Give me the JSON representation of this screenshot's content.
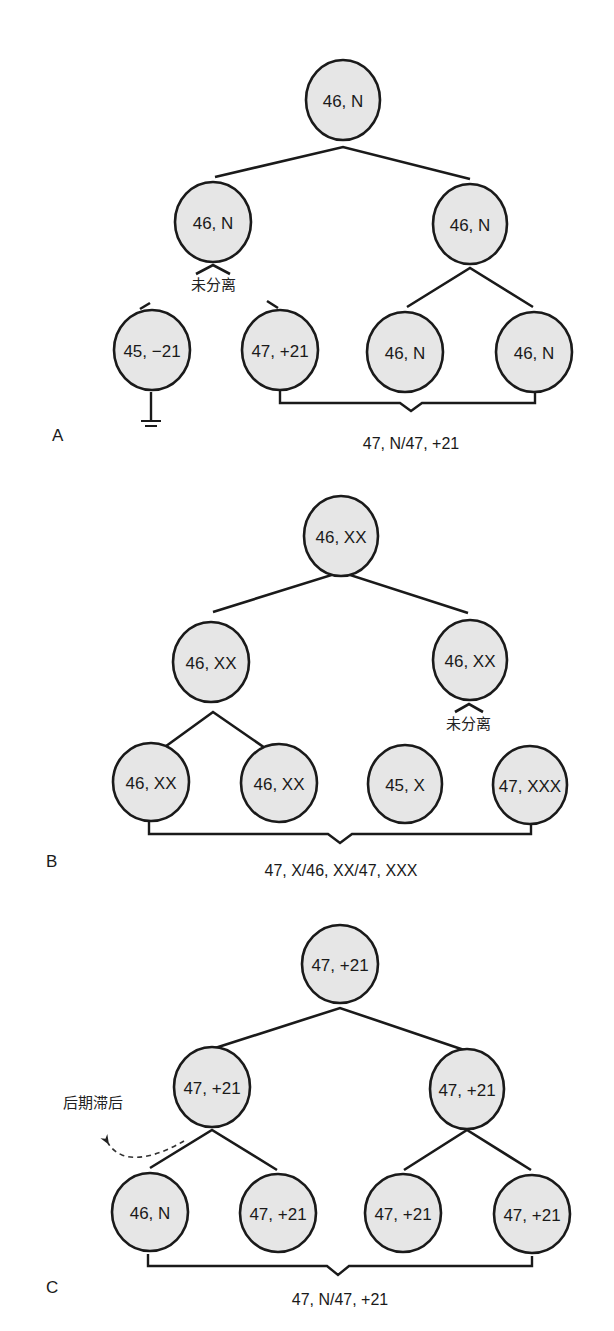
{
  "panels": {
    "A": {
      "letter": "A",
      "root": "46, N",
      "level2": [
        "46, N",
        "46, N"
      ],
      "level3": [
        "45, −21",
        "47, +21",
        "46, N",
        "46, N"
      ],
      "nondisjunction_label": "未分离",
      "result_label": "47, N/47, +21",
      "lost_cell_symbol": "ground-icon"
    },
    "B": {
      "letter": "B",
      "root": "46, XX",
      "level2": [
        "46, XX",
        "46, XX"
      ],
      "level3": [
        "46, XX",
        "46, XX",
        "45, X",
        "47, XXX"
      ],
      "nondisjunction_label": "未分离",
      "result_label": "47, X/46, XX/47, XXX"
    },
    "C": {
      "letter": "C",
      "root": "47, +21",
      "level2": [
        "47, +21",
        "47, +21"
      ],
      "level3": [
        "46,  N",
        "47, +21",
        "47, +21",
        "47, +21"
      ],
      "anaphase_lag_label": "后期滞后",
      "result_label": "47, N/47,  +21"
    }
  },
  "colors": {
    "cell_fill": "#e6e6e6",
    "stroke": "#1a1a1a",
    "background": "#ffffff"
  }
}
